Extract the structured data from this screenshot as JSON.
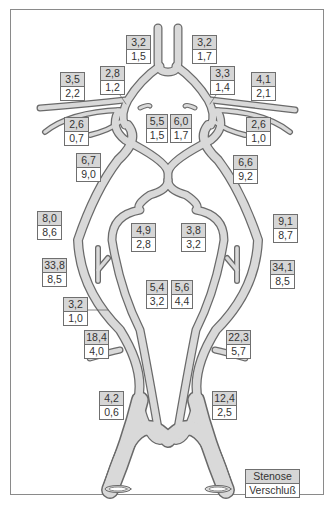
{
  "diagram": {
    "colors": {
      "vessel_fill": "#d9d9d9",
      "vessel_stroke": "#6a6a6a",
      "stenose_box": "#d6d6d6",
      "verschluss_box": "#ffffff",
      "border": "#8a8a8a"
    },
    "legend": {
      "stenose": "Stenose",
      "verschluss": "Verschluß"
    },
    "labels": [
      {
        "id": "l1",
        "stenose": "3,2",
        "verschluss": "1,5"
      },
      {
        "id": "l2",
        "stenose": "3,2",
        "verschluss": "1,7"
      },
      {
        "id": "l3",
        "stenose": "3,5",
        "verschluss": "2,2"
      },
      {
        "id": "l4",
        "stenose": "2,8",
        "verschluss": "1,2"
      },
      {
        "id": "l5",
        "stenose": "3,3",
        "verschluss": "1,4"
      },
      {
        "id": "l6",
        "stenose": "4,1",
        "verschluss": "2,1"
      },
      {
        "id": "l7",
        "stenose": "2,6",
        "verschluss": "0,7"
      },
      {
        "id": "l8",
        "stenose": "5,5",
        "verschluss": "1,5"
      },
      {
        "id": "l9",
        "stenose": "6,0",
        "verschluss": "1,7"
      },
      {
        "id": "l10",
        "stenose": "2,6",
        "verschluss": "1,0"
      },
      {
        "id": "l11",
        "stenose": "6,7",
        "verschluss": "9,0"
      },
      {
        "id": "l12",
        "stenose": "6,6",
        "verschluss": "9,2"
      },
      {
        "id": "l13",
        "stenose": "8,0",
        "verschluss": "8,6"
      },
      {
        "id": "l14",
        "stenose": "4,9",
        "verschluss": "2,8"
      },
      {
        "id": "l15",
        "stenose": "3,8",
        "verschluss": "3,2"
      },
      {
        "id": "l16",
        "stenose": "9,1",
        "verschluss": "8,7"
      },
      {
        "id": "l17",
        "stenose": "33,8",
        "verschluss": "8,5"
      },
      {
        "id": "l18",
        "stenose": "34,1",
        "verschluss": "8,5"
      },
      {
        "id": "l19",
        "stenose": "5,4",
        "verschluss": "3,2"
      },
      {
        "id": "l20",
        "stenose": "5,6",
        "verschluss": "4,4"
      },
      {
        "id": "l21",
        "stenose": "3,2",
        "verschluss": "1,0"
      },
      {
        "id": "l22",
        "stenose": "18,4",
        "verschluss": "4,0"
      },
      {
        "id": "l23",
        "stenose": "22,3",
        "verschluss": "5,7"
      },
      {
        "id": "l24",
        "stenose": "4,2",
        "verschluss": "0,6"
      },
      {
        "id": "l25",
        "stenose": "12,4",
        "verschluss": "2,5"
      }
    ]
  }
}
